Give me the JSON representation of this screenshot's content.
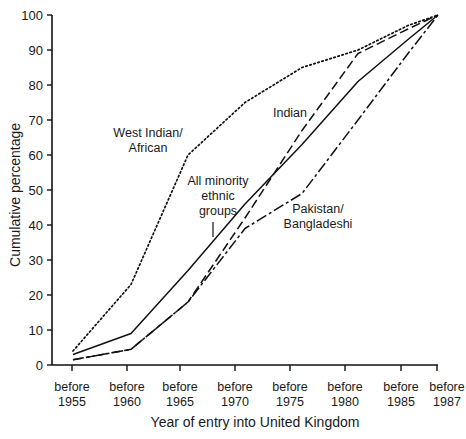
{
  "chart_data": {
    "type": "line",
    "title": "",
    "xlabel": "Year of entry into United Kingdom",
    "ylabel": "Cumulative percentage",
    "ylim": [
      0,
      100
    ],
    "yticks": [
      0,
      10,
      20,
      30,
      40,
      50,
      60,
      70,
      80,
      90,
      100
    ],
    "categories": [
      "before 1955",
      "before 1960",
      "before 1965",
      "before 1970",
      "before 1975",
      "before 1980",
      "before 1985",
      "before 1987"
    ],
    "category_lines": [
      [
        "before",
        "1955"
      ],
      [
        "before",
        "1960"
      ],
      [
        "before",
        "1965"
      ],
      [
        "before",
        "1970"
      ],
      [
        "before",
        "1975"
      ],
      [
        "before",
        "1980"
      ],
      [
        "before",
        "1985"
      ],
      [
        "before",
        "1987"
      ]
    ],
    "grid": false,
    "legend": "inline labels",
    "series": [
      {
        "name": "West Indian/ African",
        "style": "dotted",
        "values": [
          4,
          23,
          60,
          75,
          85,
          90,
          97,
          100
        ]
      },
      {
        "name": "All minority ethnic groups",
        "style": "solid",
        "values": [
          3,
          9,
          27,
          46,
          63,
          81,
          93,
          100
        ]
      },
      {
        "name": "Indian",
        "style": "dashed",
        "values": [
          1.5,
          4.5,
          18,
          42,
          67,
          89,
          96,
          100
        ]
      },
      {
        "name": "Pakistan/ Bangladeshi",
        "style": "dash-dot",
        "values": [
          1.5,
          4.5,
          18,
          39,
          49,
          70,
          89,
          100
        ]
      }
    ],
    "annotations": [
      {
        "text_lines": [
          "West Indian/",
          "African"
        ],
        "series": "West Indian/ African"
      },
      {
        "text_lines": [
          "All minority",
          "ethnic",
          "groups"
        ],
        "series": "All minority ethnic groups"
      },
      {
        "text_lines": [
          "Indian"
        ],
        "series": "Indian"
      },
      {
        "text_lines": [
          "Pakistan/",
          "Bangladeshi"
        ],
        "series": "Pakistan/ Bangladeshi"
      }
    ]
  }
}
